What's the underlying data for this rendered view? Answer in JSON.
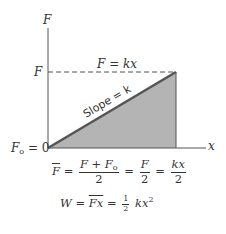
{
  "diagram": {
    "type": "force-displacement graph",
    "axes": {
      "y_label": "F",
      "x_label": "x"
    },
    "labels": {
      "force_level": "F",
      "origin": "F",
      "origin_sub": "o",
      "origin_value": " = 0",
      "dashed_line": "F = kx",
      "slope": "Slope = k"
    },
    "colors": {
      "fill": "#b4b4b4",
      "line": "#555555",
      "axis": "#555555"
    },
    "equations": {
      "avg_force": {
        "lhs": "F",
        "eq1": "=",
        "frac1_num_a": "F + F",
        "frac1_num_sub": "o",
        "frac1_den": "2",
        "eq2": "=",
        "frac2_num": "F",
        "frac2_den": "2",
        "eq3": "=",
        "frac3_num": "kx",
        "frac3_den": "2"
      },
      "work": {
        "lhs": "W",
        "eq1": "=",
        "mid": "Fx",
        "eq2": "=",
        "half_num": "1",
        "half_den": "2",
        "rhs": "kx",
        "rhs_exp": "2"
      }
    }
  }
}
